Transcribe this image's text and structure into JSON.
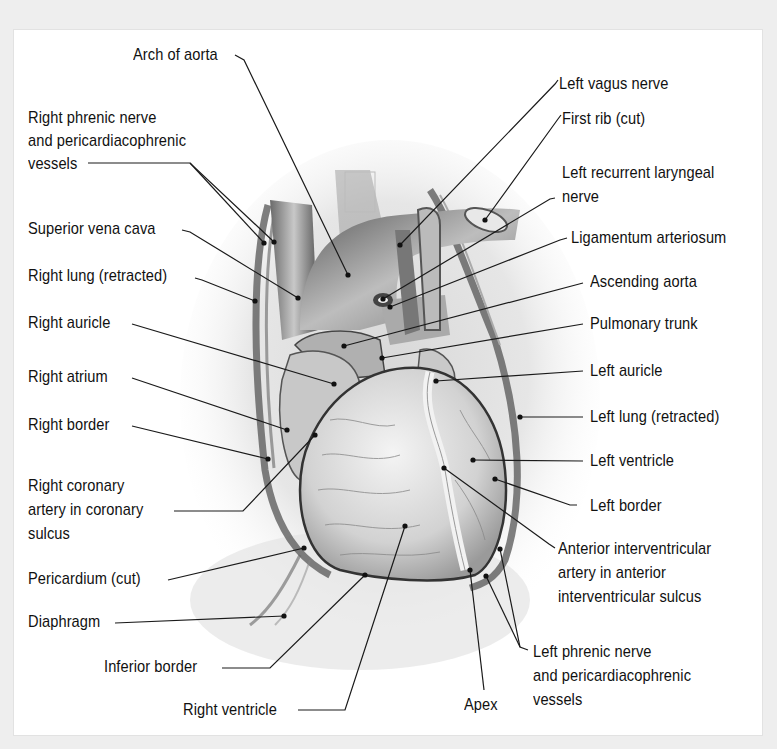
{
  "figure": {
    "background": "#eeeeee",
    "panel_background": "#ffffff",
    "leader_color": "#1a1a1a"
  },
  "labels": {
    "arch_of_aorta": "Arch of aorta",
    "right_phrenic_1": "Right phrenic nerve",
    "right_phrenic_2": "and pericardiacophrenic",
    "right_phrenic_3": "vessels",
    "superior_vena_cava": "Superior vena cava",
    "right_lung": "Right lung (retracted)",
    "right_auricle": "Right auricle",
    "right_atrium": "Right atrium",
    "right_border": "Right border",
    "right_coronary_1": "Right coronary",
    "right_coronary_2": "artery in coronary",
    "right_coronary_3": "sulcus",
    "pericardium": "Pericardium (cut)",
    "diaphragm": "Diaphragm",
    "inferior_border": "Inferior border",
    "right_ventricle": "Right ventricle",
    "apex": "Apex",
    "left_vagus": "Left vagus nerve",
    "first_rib": "First rib (cut)",
    "left_recurrent_1": "Left recurrent laryngeal",
    "left_recurrent_2": "nerve",
    "ligamentum": "Ligamentum arteriosum",
    "ascending_aorta": "Ascending aorta",
    "pulmonary_trunk": "Pulmonary trunk",
    "left_auricle": "Left auricle",
    "left_lung": "Left lung (retracted)",
    "left_ventricle": "Left ventricle",
    "left_border": "Left border",
    "anterior_iv_1": "Anterior interventricular",
    "anterior_iv_2": "artery in anterior",
    "anterior_iv_3": "interventricular sulcus",
    "left_phrenic_1": "Left phrenic nerve",
    "left_phrenic_2": "and pericardiacophrenic",
    "left_phrenic_3": "vessels"
  }
}
